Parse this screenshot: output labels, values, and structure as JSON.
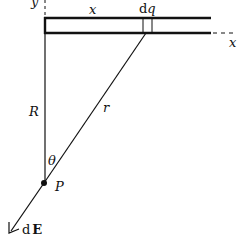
{
  "diagram": {
    "labels": {
      "y_axis": "y",
      "x_top": "x",
      "dq": "dq",
      "x_axis": "x",
      "R": "R",
      "r": "r",
      "theta": "θ",
      "P": "P",
      "dE": "dE"
    },
    "colors": {
      "stroke": "#111111",
      "background": "#ffffff"
    }
  }
}
